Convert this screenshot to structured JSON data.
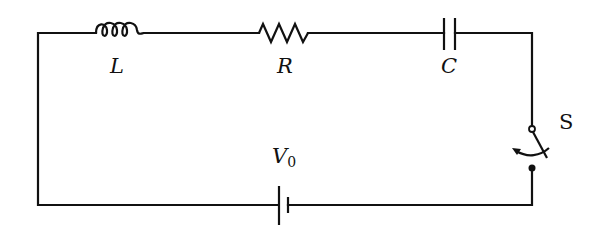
{
  "diagram": {
    "type": "series RLC circuit",
    "components": [
      {
        "id": "inductor",
        "symbol": "L",
        "kind": "inductor"
      },
      {
        "id": "resistor",
        "symbol": "R",
        "kind": "resistor"
      },
      {
        "id": "capacitor",
        "symbol": "C",
        "kind": "capacitor"
      },
      {
        "id": "switch",
        "symbol": "S",
        "kind": "switch",
        "state": "open"
      },
      {
        "id": "battery",
        "symbol": "V",
        "subscript": "0",
        "kind": "dc-source"
      }
    ],
    "labels": {
      "inductor": "L",
      "resistor": "R",
      "capacitor": "C",
      "switch": "S",
      "battery_main": "V",
      "battery_sub": "0"
    },
    "colors": {
      "stroke": "#111111",
      "background": "#ffffff"
    }
  }
}
